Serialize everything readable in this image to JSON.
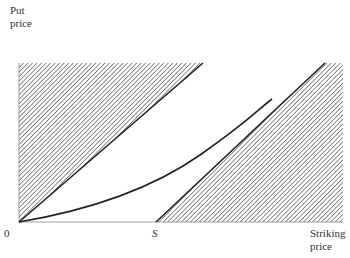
{
  "diagram": {
    "type": "option-price-bounds",
    "y_axis_label_line1": "Put",
    "y_axis_label_line2": "price",
    "x_axis_label_line1": "Striking",
    "x_axis_label_line2": "price",
    "origin_label": "0",
    "strike_marker_label": "S",
    "elements": [
      {
        "name": "upper-bound-line",
        "from": "origin",
        "to": "top",
        "description": "diagonal from origin; region above-left hatched"
      },
      {
        "name": "lower-bound-line",
        "from": "S",
        "to": "top-right",
        "description": "diagonal from S; region below-right hatched"
      },
      {
        "name": "put-price-curve",
        "description": "convex curve from origin rising between the bounds"
      }
    ],
    "colors": {
      "line": "#222222",
      "hatch": "#555555",
      "background": "#ffffff"
    }
  }
}
